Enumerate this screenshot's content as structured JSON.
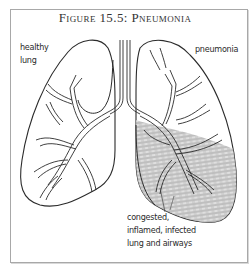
{
  "figure": {
    "title": "Figure 15.5: Pneumonia"
  },
  "labels": {
    "healthy_line1": "healthy",
    "healthy_line2": "lung",
    "pneumonia": "pneumonia",
    "congested_line1": "congested,",
    "congested_line2": "inflamed, infected",
    "congested_line3": "lung and airways"
  },
  "colors": {
    "outline": "#2b2b2b",
    "frame": "#a8a8a8",
    "congestion_shading": "#8a8a8a"
  }
}
